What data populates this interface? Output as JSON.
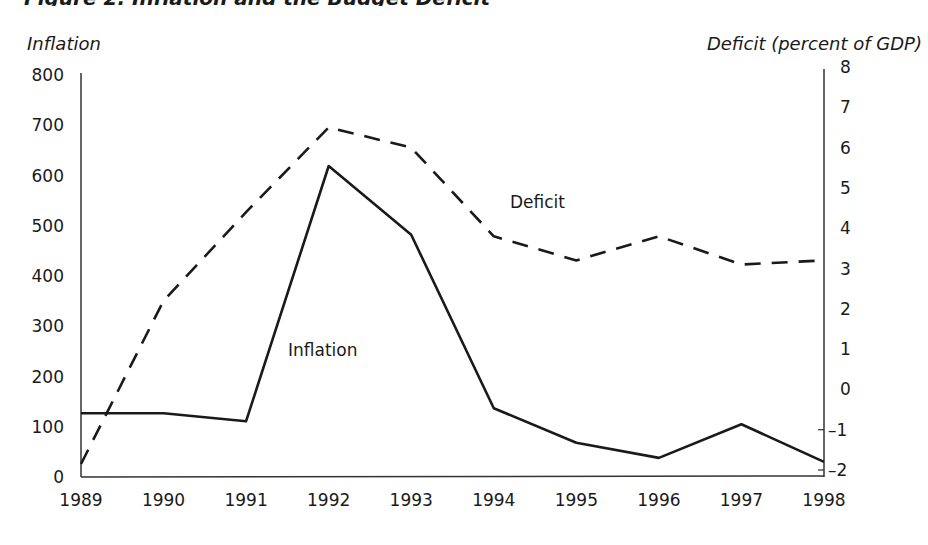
{
  "figure": {
    "title": "Figure 2. Inflation and the Budget Deficit",
    "left_axis_title": "Inflation",
    "right_axis_title": "Deficit (percent of GDP)"
  },
  "chart_data": {
    "type": "line",
    "title": "Figure 2. Inflation and the Budget Deficit",
    "xlabel": "",
    "ylabel": "Inflation",
    "y2label": "Deficit (percent of GDP)",
    "x": [
      1989,
      1990,
      1991,
      1992,
      1993,
      1994,
      1995,
      1996,
      1997,
      1998
    ],
    "series": [
      {
        "name": "Inflation",
        "axis": "left",
        "style": "solid",
        "label": "Inflation",
        "values": [
          127,
          127,
          111,
          619,
          482,
          137,
          68,
          38,
          105,
          30
        ]
      },
      {
        "name": "Deficit",
        "axis": "right",
        "style": "dashed",
        "label": "Deficit",
        "values": [
          -1.85,
          2.2,
          4.4,
          6.5,
          6.0,
          3.8,
          3.2,
          3.8,
          3.1,
          3.2
        ]
      }
    ],
    "ylim": [
      0,
      800
    ],
    "y2lim": [
      -2,
      8
    ],
    "yticks": [
      0,
      100,
      200,
      300,
      400,
      500,
      600,
      700,
      800
    ],
    "y2ticks": [
      -2,
      -1,
      0,
      1,
      2,
      3,
      4,
      5,
      6,
      7,
      8
    ],
    "xticks": [
      1989,
      1990,
      1991,
      1992,
      1993,
      1994,
      1995,
      1996,
      1997,
      1998
    ],
    "grid": false,
    "legend": "inline labels"
  }
}
